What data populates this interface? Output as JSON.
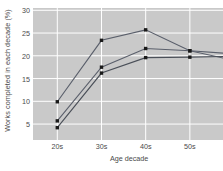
{
  "chart_data": {
    "type": "line",
    "title": "",
    "xlabel": "Age decade",
    "ylabel": "Works completed in each decade (%)",
    "categories": [
      "20s",
      "30s",
      "40s",
      "50s"
    ],
    "x_tick_labels": [
      "20s",
      "30s",
      "40s",
      "50s"
    ],
    "y_tick_labels": [
      "5",
      "10",
      "15",
      "20",
      "25",
      "30"
    ],
    "y_ticks": [
      5,
      10,
      15,
      20,
      25,
      30
    ],
    "ylim": [
      1.5,
      30.5
    ],
    "xlim": [
      0,
      4.3
    ],
    "grid": true,
    "grid_color": "#ffffff",
    "plot_background": "#c9c9c9",
    "legend": "none",
    "cropped_right_edge": true,
    "series": [
      {
        "name": "series-1",
        "color": "#5a5f6b",
        "marker": "square",
        "values": [
          9.9,
          23.4,
          25.7,
          21.1
        ],
        "extends_past_last_point": true,
        "extension_value": 19.0
      },
      {
        "name": "series-2",
        "color": "#5a5f6b",
        "marker": "square",
        "values": [
          5.7,
          17.5,
          21.6,
          21.1
        ],
        "extends_past_last_point": true,
        "extension_value": 20.4
      },
      {
        "name": "series-3",
        "color": "#4a4f58",
        "marker": "square",
        "values": [
          4.2,
          16.2,
          19.6,
          19.7
        ],
        "extends_past_last_point": true,
        "extension_value": 19.9
      }
    ]
  }
}
